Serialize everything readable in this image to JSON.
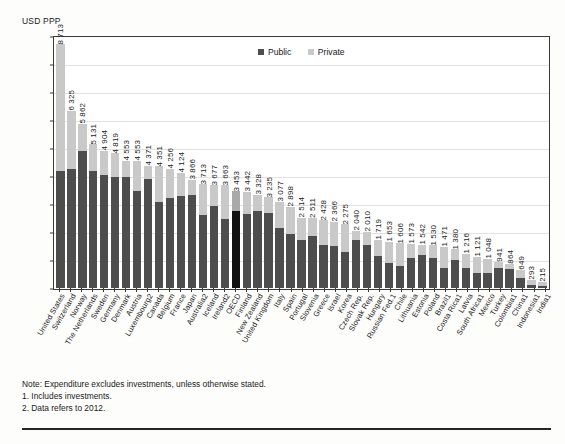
{
  "axis_unit_label": "USD PPP",
  "legend": [
    {
      "name": "Public",
      "color": "#4d4d4d"
    },
    {
      "name": "Private",
      "color": "#c9c9c9"
    }
  ],
  "notes": [
    "Note: Expenditure excludes investments, unless otherwise stated.",
    "1. Includes investments.",
    "2. Data refers to 2012."
  ],
  "chart_data": {
    "type": "bar",
    "subtype": "stacked-bar",
    "title": "",
    "xlabel": "",
    "ylabel": "USD PPP",
    "ylim": [
      0,
      9000
    ],
    "yticks": [
      0,
      1000,
      2000,
      3000,
      4000,
      5000,
      6000,
      7000,
      8000,
      9000
    ],
    "ytick_labels": [
      "0",
      "1000",
      "2000",
      "3000",
      "4000",
      "5000",
      "6000",
      "7000",
      "8000",
      "9000"
    ],
    "grid": true,
    "legend_position": "top-center",
    "highlight_category": "OECD",
    "series": [
      {
        "name": "Public",
        "color": "#4d4d4d"
      },
      {
        "name": "Private",
        "color": "#c9c9c9"
      }
    ],
    "categories": [
      "United States",
      "Switzerland",
      "Norway",
      "The Netherlands",
      "Sweden",
      "Germany",
      "Denmark",
      "Austria",
      "Luxembourg2",
      "Canada",
      "Belgium",
      "France",
      "Japan",
      "Australia2",
      "Iceland",
      "Ireland2",
      "OECD",
      "Finland",
      "New Zealand",
      "United Kingdom",
      "Italy",
      "Spain",
      "Portugal",
      "Slovenia",
      "Greece",
      "Israel",
      "Korea",
      "Czech Rep.",
      "Slovak Rep.",
      "Hungary",
      "Russian Fed.1",
      "Chile",
      "Lithuania",
      "Estonia",
      "Poland",
      "Brazil1",
      "Costa Rica1",
      "Latvia",
      "South Africa1",
      "Mexico",
      "Turkey",
      "Colombia1",
      "China1",
      "Indonesia1",
      "India1"
    ],
    "totals": [
      8713,
      6325,
      5862,
      5131,
      4904,
      4819,
      4553,
      4553,
      4371,
      4351,
      4256,
      4124,
      3866,
      3713,
      3677,
      3663,
      3453,
      3442,
      3328,
      3235,
      3077,
      2898,
      2514,
      2511,
      2428,
      2366,
      2275,
      2040,
      2010,
      1719,
      1653,
      1606,
      1573,
      1542,
      1530,
      1471,
      1380,
      1216,
      1121,
      1048,
      941,
      864,
      649,
      293,
      215
    ],
    "public_values": [
      4197,
      4263,
      4906,
      4190,
      4054,
      3966,
      3960,
      3473,
      3907,
      3061,
      3221,
      3272,
      3307,
      2619,
      2946,
      2461,
      2742,
      2628,
      2758,
      2685,
      2139,
      1924,
      1700,
      1857,
      1539,
      1512,
      1288,
      1708,
      1531,
      1158,
      895,
      789,
      1055,
      1195,
      1062,
      706,
      1013,
      726,
      538,
      548,
      729,
      678,
      359,
      114,
      65
    ],
    "private_values": [
      4516,
      2062,
      956,
      941,
      850,
      853,
      593,
      1080,
      464,
      1290,
      1035,
      852,
      559,
      1094,
      731,
      1202,
      711,
      814,
      570,
      550,
      938,
      974,
      814,
      654,
      889,
      854,
      987,
      332,
      479,
      561,
      758,
      817,
      518,
      347,
      468,
      765,
      367,
      490,
      583,
      500,
      212,
      186,
      290,
      179,
      150
    ],
    "value_labels": [
      "8 713",
      "6 325",
      "5 862",
      "5 131",
      "4 904",
      "4 819",
      "4 553",
      "4 553",
      "4 371",
      "4 351",
      "4 256",
      "4 124",
      "3 866",
      "3 713",
      "3 677",
      "3 663",
      "3 453",
      "3 442",
      "3 328",
      "3 235",
      "3 077",
      "2 898",
      "2 514",
      "2 511",
      "2 428",
      "2 366",
      "2 275",
      "2 040",
      "2 010",
      "1 719",
      "1 653",
      "1 606",
      "1 573",
      "1 542",
      "1 530",
      "1 471",
      "1 380",
      "1 216",
      "1 121",
      "1 048",
      "941",
      "864",
      "649",
      "293",
      "215"
    ]
  }
}
